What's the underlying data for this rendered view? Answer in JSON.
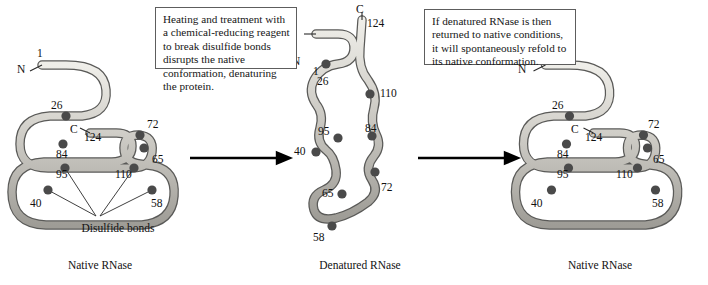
{
  "figure": {
    "callouts": [
      {
        "id": "denature-callout",
        "text": "Heating and treatment with a chemical-reducing reagent to break disulfide bonds disrupts the native conformation, denaturing the protein."
      },
      {
        "id": "renature-callout",
        "text": "If denatured RNase is then returned to native conditions, it will spontaneously refold to its native conformation."
      }
    ],
    "captions": {
      "left": "Native RNase",
      "middle": "Denatured RNase",
      "right": "Native RNase"
    },
    "annotation": {
      "disulfide_bonds_label": "Disulfide bonds"
    },
    "termini": {
      "n_terminus": "N",
      "c_terminus": "C"
    },
    "colors": {
      "ribbon_fill": "#c9c7c2",
      "ribbon_highlight": "#eceae6",
      "ribbon_outline": "#5a5a58",
      "cysteine_dot": "#4a4a4a",
      "callout_border": "#5d5d5d",
      "arrow": "#000000",
      "background": "#ffffff"
    },
    "panels": {
      "native_left": {
        "name": "Native RNase",
        "residue_labels": [
          "1",
          "26",
          "84",
          "72",
          "65",
          "124",
          "95",
          "110",
          "40",
          "58"
        ],
        "terminus_labels": [
          "N",
          "C"
        ],
        "cysteine_count": 8
      },
      "denatured": {
        "name": "Denatured RNase",
        "residue_labels": [
          "124",
          "1",
          "26",
          "110",
          "95",
          "84",
          "40",
          "72",
          "65",
          "58"
        ],
        "terminus_labels": [
          "C",
          "N"
        ],
        "cysteine_count": 8
      },
      "native_right": {
        "name": "Native RNase",
        "residue_labels": [
          "1",
          "26",
          "84",
          "72",
          "65",
          "124",
          "95",
          "110",
          "40",
          "58"
        ],
        "terminus_labels": [
          "N",
          "C"
        ],
        "cysteine_count": 8
      }
    }
  }
}
